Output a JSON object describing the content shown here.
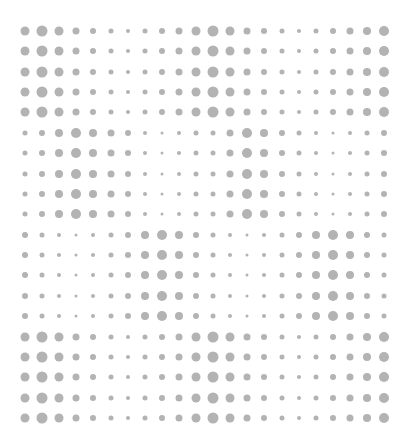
{
  "canvas": {
    "width": 411,
    "height": 442,
    "background": "#ffffff",
    "dot_color": "#b3b3b3"
  },
  "grid": {
    "columns": 22,
    "rows": 20,
    "x_start": 25,
    "x_step": 17.1,
    "y_start": 31,
    "y_step": 20.37
  },
  "patterns": {
    "A": [
      9,
      11,
      9,
      7,
      6,
      5,
      4,
      5,
      6,
      7,
      9,
      11,
      9,
      7,
      6,
      5,
      4,
      5,
      6,
      7,
      8,
      10
    ],
    "B": [
      5,
      6,
      8,
      10,
      8,
      7,
      6,
      4,
      3,
      4,
      5,
      5,
      7,
      10,
      8,
      6,
      5,
      4,
      3,
      4,
      5,
      6
    ],
    "C": [
      6,
      5,
      4,
      3,
      4,
      5,
      6,
      8,
      10,
      8,
      6,
      5,
      4,
      3,
      4,
      5,
      6,
      8,
      10,
      8,
      6,
      5
    ]
  },
  "row_patterns": [
    "A",
    "A",
    "A",
    "A",
    "A",
    "B",
    "B",
    "B",
    "B",
    "B",
    "C",
    "C",
    "C",
    "C",
    "C",
    "A",
    "A",
    "A",
    "A",
    "A"
  ]
}
